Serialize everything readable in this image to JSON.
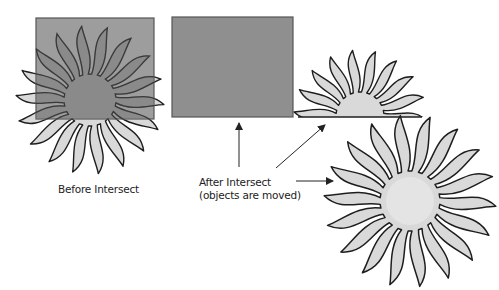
{
  "labels": {
    "before": "Before Intersect",
    "after_line1": "After Intersect",
    "after_line2": "(objects are moved)"
  },
  "colors": {
    "box_fill": "#8f8f8f",
    "box_stroke": "#555555",
    "sun_fill": "#d9d9d9",
    "sun_center": "#e4e4e4",
    "outline": "#1e1e1e",
    "arrow": "#222222",
    "text": "#222222"
  },
  "figures": {
    "before_box": {
      "x": 36,
      "y": 18,
      "w": 118,
      "h": 101
    },
    "before_sun": {
      "cx": 90,
      "cy": 100,
      "r_outer": 74,
      "r_inner": 26,
      "rays": 18
    },
    "after_box": {
      "x": 172,
      "y": 17,
      "w": 121,
      "h": 100
    },
    "after_half_sun": {
      "cx": 360,
      "cy": 116,
      "r_outer": 66,
      "r_inner": 24,
      "rays": 18,
      "clip_y": 117
    },
    "after_sun": {
      "cx": 410,
      "cy": 201,
      "r_outer": 86,
      "r_inner": 30,
      "rays": 18
    }
  },
  "arrows": [
    {
      "x1": 239,
      "y1": 167,
      "x2": 239,
      "y2": 123
    },
    {
      "x1": 276,
      "y1": 168,
      "x2": 325,
      "y2": 125
    },
    {
      "x1": 296,
      "y1": 181,
      "x2": 333,
      "y2": 181
    }
  ]
}
